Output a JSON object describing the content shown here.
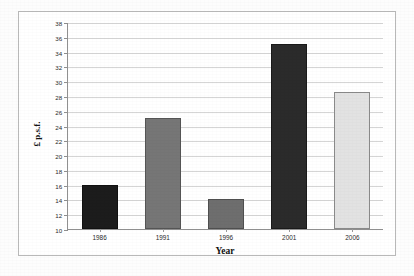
{
  "chart_data": {
    "type": "bar",
    "title": "",
    "subtitle": "",
    "xlabel": "Year",
    "ylabel": "£ p.s.f.",
    "categories": [
      "1986",
      "1991",
      "1996",
      "2001",
      "2006"
    ],
    "values": [
      16,
      25,
      14,
      35,
      28.5
    ],
    "series": [
      {
        "name": "£ p.s.f.",
        "values": [
          16,
          25,
          14,
          35,
          28.5
        ]
      }
    ],
    "bar_colors": [
      "#1c1c1c",
      "#767676",
      "#6e6e6e",
      "#2b2b2b",
      "#e2e2e2"
    ],
    "bar_border_colors": [
      "#111111",
      "#555555",
      "#4f4f4f",
      "#1a1a1a",
      "#8a8a8a"
    ],
    "ylim": [
      10,
      38
    ],
    "ytick_step": 2,
    "yticks": [
      "38",
      "36",
      "34",
      "32",
      "30",
      "28",
      "26",
      "24",
      "22",
      "20",
      "18",
      "16",
      "14",
      "12",
      "10"
    ],
    "grid": true,
    "grid_axis": "y",
    "legend": false,
    "legend_position": "none",
    "frame": true
  },
  "colors": {
    "gridline": "#d5d5d5",
    "axis": "#8f8f8f",
    "frame": "#b9b9b9",
    "text": "#2a2a2a",
    "background": "#ffffff"
  }
}
